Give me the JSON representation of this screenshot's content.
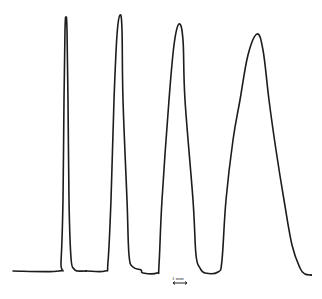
{
  "chart_data": {
    "type": "line",
    "title": "",
    "xlabel": "",
    "ylabel": "",
    "grid": false,
    "legend": null,
    "scale_bar": {
      "label": "1 mm",
      "orientation": "horizontal",
      "double_headed": true
    },
    "baseline_level": 0,
    "peaks": [
      {
        "index": 1,
        "relative_height": 1.0,
        "relative_base_width": 1.0
      },
      {
        "index": 2,
        "relative_height": 1.01,
        "relative_base_width": 1.7
      },
      {
        "index": 3,
        "relative_height": 0.97,
        "relative_base_width": 2.3
      },
      {
        "index": 4,
        "relative_height": 0.93,
        "relative_base_width": 4.0
      }
    ],
    "points_px": [
      [
        13,
        271
      ],
      [
        59,
        271
      ],
      [
        61,
        262
      ],
      [
        63,
        200
      ],
      [
        64,
        100
      ],
      [
        65,
        30
      ],
      [
        66,
        17
      ],
      [
        67,
        30
      ],
      [
        68,
        100
      ],
      [
        69,
        200
      ],
      [
        71,
        258
      ],
      [
        74,
        269
      ],
      [
        78,
        271
      ],
      [
        86,
        271
      ],
      [
        105,
        271
      ],
      [
        108,
        262
      ],
      [
        111,
        200
      ],
      [
        114,
        100
      ],
      [
        117,
        35
      ],
      [
        120,
        15
      ],
      [
        122,
        30
      ],
      [
        123,
        100
      ],
      [
        127,
        200
      ],
      [
        129,
        255
      ],
      [
        133,
        267
      ],
      [
        141,
        270
      ],
      [
        143,
        273
      ],
      [
        157,
        273
      ],
      [
        159,
        265
      ],
      [
        162,
        200
      ],
      [
        169,
        100
      ],
      [
        174,
        45
      ],
      [
        179,
        24
      ],
      [
        183,
        40
      ],
      [
        185,
        100
      ],
      [
        193,
        200
      ],
      [
        196,
        255
      ],
      [
        200,
        268
      ],
      [
        205,
        273
      ],
      [
        218,
        272
      ],
      [
        222,
        260
      ],
      [
        226,
        200
      ],
      [
        233,
        140
      ],
      [
        240,
        100
      ],
      [
        248,
        55
      ],
      [
        257,
        34
      ],
      [
        263,
        50
      ],
      [
        269,
        100
      ],
      [
        276,
        150
      ],
      [
        284,
        200
      ],
      [
        292,
        245
      ],
      [
        300,
        268
      ],
      [
        305,
        274
      ],
      [
        311,
        275
      ]
    ]
  },
  "scale_bar": {
    "label": "1 mm"
  },
  "colors": {
    "trace": "#1c1c1c",
    "background": "#ffffff"
  }
}
